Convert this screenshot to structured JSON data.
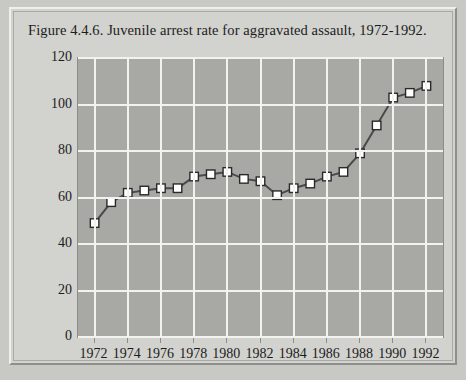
{
  "chart_data": {
    "type": "line",
    "title": "Figure 4.4.6. Juvenile arrest rate for aggravated assault, 1972-1992.",
    "xlabel": "",
    "ylabel": "Arrests per 100,000",
    "x": [
      1972,
      1973,
      1974,
      1975,
      1976,
      1977,
      1978,
      1979,
      1980,
      1981,
      1982,
      1983,
      1984,
      1985,
      1986,
      1987,
      1988,
      1989,
      1990,
      1991,
      1992
    ],
    "values": [
      49,
      58,
      62,
      63,
      64,
      64,
      69,
      70,
      71,
      68,
      67,
      61,
      64,
      66,
      69,
      71,
      79,
      91,
      103,
      105,
      108
    ],
    "series": [
      {
        "name": "Juvenile arrest rate for aggravated assault",
        "values": [
          49,
          58,
          62,
          63,
          64,
          64,
          69,
          70,
          71,
          68,
          67,
          61,
          64,
          66,
          69,
          71,
          79,
          91,
          103,
          105,
          108
        ]
      }
    ],
    "xlim": [
      1971,
      1993
    ],
    "ylim": [
      0,
      120
    ],
    "ytick_labels": [
      "0",
      "20",
      "40",
      "60",
      "80",
      "100",
      "120"
    ],
    "yticks": [
      0,
      20,
      40,
      60,
      80,
      100,
      120
    ],
    "xtick_labels": [
      "1972",
      "1974",
      "1976",
      "1978",
      "1980",
      "1982",
      "1984",
      "1986",
      "1988",
      "1990",
      "1992"
    ],
    "xticks": [
      1972,
      1974,
      1976,
      1978,
      1980,
      1982,
      1984,
      1986,
      1988,
      1990,
      1992
    ],
    "grid": true,
    "legend": "none",
    "marker": "square",
    "colors": {
      "plot_background": "#a8a8a4",
      "figure_background": "#d2d2ce",
      "gridline": "#f2f2ef",
      "line": "#4a4a4a",
      "marker_fill": "#ffffff",
      "marker_edge": "#2a2a2a",
      "text": "#1c1c1c"
    }
  }
}
